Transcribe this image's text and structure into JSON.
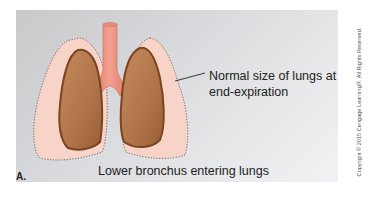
{
  "figure": {
    "panel_label": "A.",
    "callout_line1": "Normal size of lungs at",
    "callout_line2": "end-expiration",
    "caption": "Lower bronchus entering lungs",
    "copyright": "Copyright © 2015 Cengage Learning®. All Rights Reserved."
  },
  "colors": {
    "outer_lung": "#f8d3c8",
    "inner_lung": "#b8794c",
    "inner_lung_edge": "#7a4520",
    "trachea": "#e98a78",
    "dotted_outline": "#6b5a55"
  }
}
